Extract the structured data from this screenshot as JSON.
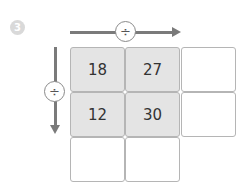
{
  "problem": {
    "number": "3",
    "horizontal_operator": "÷",
    "vertical_operator": "÷"
  },
  "grid": {
    "rows": [
      [
        "18",
        "27",
        ""
      ],
      [
        "12",
        "30",
        ""
      ],
      [
        "",
        "",
        null
      ]
    ]
  },
  "colors": {
    "filled_cell": "#e4e4e4",
    "arrow": "#7a7a7a",
    "badge": "#d9d9d9"
  }
}
